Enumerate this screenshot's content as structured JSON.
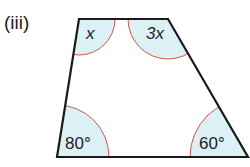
{
  "question_label": "(iii)",
  "shape": "quadrilateral (trapezium)",
  "angles": {
    "top_left": "x",
    "top_right": "3x",
    "bottom_left": "80°",
    "bottom_right": "60°"
  },
  "colors": {
    "outline": "#1a1a1a",
    "arc": "#d9534f",
    "fill": "#dcf1f5"
  }
}
